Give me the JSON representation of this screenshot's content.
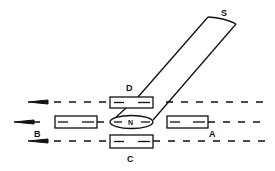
{
  "diagram": {
    "type": "magnetic-field-compass-diagram",
    "labels": {
      "south_pole": "S",
      "north_pole": "N",
      "position_a": "A",
      "position_b": "B",
      "position_c": "C",
      "position_d": "D"
    },
    "field_lines": [
      {
        "name": "upper",
        "direction": "left"
      },
      {
        "name": "middle",
        "direction": "left"
      },
      {
        "name": "lower",
        "direction": "left"
      }
    ],
    "colors": {
      "stroke": "#111111",
      "background": "#ffffff"
    }
  }
}
